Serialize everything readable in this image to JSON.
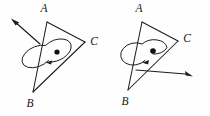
{
  "figure": {
    "background_color": "#fefefe",
    "ink_color": "#1c1c1c",
    "panels": [
      {
        "id": "left-panel",
        "name": "left-figure",
        "triangle": {
          "name": "triangle-ABC-left",
          "vertices": [
            {
              "label": "A",
              "x": 47,
              "y": 22,
              "label_x": 44,
              "label_y": 9
            },
            {
              "label": "B",
              "x": 33,
              "y": 92,
              "label_x": 30,
              "label_y": 104
            },
            {
              "label": "C",
              "x": 85,
              "y": 42,
              "label_x": 94,
              "label_y": 42
            }
          ]
        },
        "center_dot": {
          "x": 57,
          "y": 52,
          "r": 2.6
        },
        "rotation": {
          "sense": "counterclockwise",
          "arc_rx": 16,
          "arc_ry": 10,
          "arc_rotation_deg": -25,
          "arrowhead_x": 46,
          "arrowhead_y": 62,
          "arrowhead_angle_deg": 160
        },
        "vector_arrow": {
          "name": "angular-velocity-arrow-left",
          "direction": "up-left",
          "tail_x": 40,
          "tail_y": 44,
          "head_x": 12,
          "head_y": 19
        }
      },
      {
        "id": "right-panel",
        "name": "right-figure",
        "triangle": {
          "name": "triangle-ABC-right",
          "vertices": [
            {
              "label": "A",
              "x": 142,
              "y": 22,
              "label_x": 139,
              "label_y": 9
            },
            {
              "label": "B",
              "x": 128,
              "y": 90,
              "label_x": 125,
              "label_y": 102
            },
            {
              "label": "C",
              "x": 178,
              "y": 41,
              "label_x": 187,
              "label_y": 39
            }
          ]
        },
        "center_dot": {
          "x": 153,
          "y": 51,
          "r": 2.8
        },
        "rotation": {
          "sense": "counterclockwise",
          "arc_rx": 15,
          "arc_ry": 11,
          "arc_rotation_deg": -15,
          "arrowhead_x": 143,
          "arrowhead_y": 62,
          "arrowhead_angle_deg": 150
        },
        "vector_arrow": {
          "name": "angular-velocity-arrow-right",
          "direction": "down-right",
          "tail_x": 136,
          "tail_y": 70,
          "head_x": 192,
          "head_y": 76
        }
      }
    ]
  }
}
